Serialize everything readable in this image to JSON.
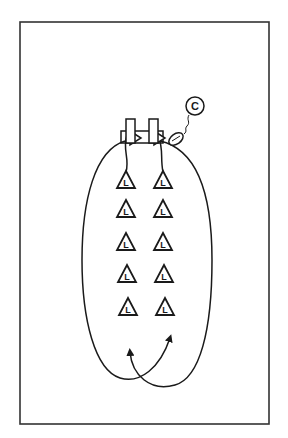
{
  "diagram": {
    "type": "football drill diagram",
    "coach": {
      "label": "C"
    },
    "players": {
      "label": "L",
      "left_column": [
        "L",
        "L",
        "L",
        "L",
        "L"
      ],
      "right_column": [
        "L",
        "L",
        "L",
        "L",
        "L"
      ]
    },
    "equipment": [
      "blocking dummy left",
      "blocking dummy right",
      "sled frame",
      "football"
    ],
    "colors": {
      "stroke": "#1a1a1a",
      "background": "#ffffff",
      "frame": "#333333"
    }
  }
}
